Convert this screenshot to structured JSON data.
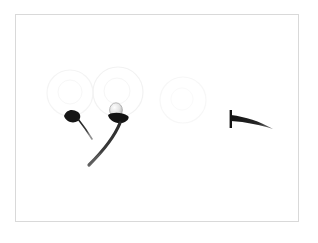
{
  "plate": {
    "background_color": "#ffffff",
    "width": 318,
    "height": 243,
    "caption": "",
    "title": ""
  },
  "frame": {
    "name": "specimen-plate-border",
    "x": 15,
    "y": 14,
    "width": 284,
    "height": 208,
    "stroke_color": "#d9d9d9",
    "stroke_width": 1,
    "fill_color": "#ffffff"
  },
  "ghost_circles": [
    {
      "label": "ghost-circle-left",
      "cx": 70,
      "cy": 93,
      "r": 23,
      "stroke_color": "#f4f4f4",
      "stroke_width": 1.2
    },
    {
      "label": "ghost-circle-middle",
      "cx": 118,
      "cy": 92,
      "r": 25,
      "stroke_color": "#f2f2f2",
      "stroke_width": 1.2
    },
    {
      "label": "ghost-circle-right",
      "cx": 183,
      "cy": 100,
      "r": 23,
      "stroke_color": "#f7f7f7",
      "stroke_width": 1.2
    }
  ],
  "specimens": [
    {
      "label": "specimen-left-small",
      "description": "small dark hooked head with thin descending tail",
      "ink_color": "#1c1c1c",
      "head": {
        "cx": 73,
        "cy": 117,
        "rx": 8,
        "ry": 4.5,
        "rotation": -18
      },
      "tail_path": "M 78 119 C 82 124, 87 131, 92 139",
      "tail_width_start": 1.6,
      "tail_width_end": 0.6
    },
    {
      "label": "specimen-center-large",
      "description": "bulbous pale head with dark collar and long curving tail",
      "ink_color": "#111111",
      "bulb": {
        "cx": 116,
        "cy": 110,
        "rx": 6.5,
        "ry": 7,
        "fill": "#e2e2e2",
        "stroke": "#9a9a9a"
      },
      "collar": {
        "cx": 119,
        "cy": 118,
        "rx": 9.5,
        "ry": 5,
        "rotation": 8
      },
      "tail_path": "M 120 123 C 114 138, 102 152, 89 165",
      "tail_width_start": 3.2,
      "tail_width_end": 0.8
    },
    {
      "label": "specimen-right",
      "description": "T-shaped form: vertical bar with tapering horizontal tail to the right",
      "ink_color": "#141414",
      "bar": {
        "x": 230,
        "y": 111,
        "width": 2.2,
        "height": 17
      },
      "tail_path": "M 231 118 C 245 120, 258 123, 272 129",
      "tail_width_start": 4.2,
      "tail_width_end": 1.0
    }
  ],
  "palette": {
    "ink": "#111111",
    "ink_soft": "#444444",
    "ghost": "#f3f3f3",
    "frame": "#d9d9d9",
    "paper": "#ffffff"
  }
}
